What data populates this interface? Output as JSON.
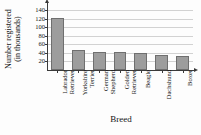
{
  "chart_data": {
    "type": "bar",
    "title": "American Kennel Club",
    "xlabel": "Breed",
    "ylabel_line1": "Number registered",
    "ylabel_line2": "(in thousands)",
    "ylabel": "Number registered (in thousands)",
    "categories": [
      "Labrador Retriever",
      "Yorkshire Terrier",
      "German Shepherd",
      "Golden Retriever",
      "Beagle",
      "Dachshund",
      "Boxer"
    ],
    "category_lines": [
      [
        "Labrador",
        "Retriever"
      ],
      [
        "Yorkshire",
        "Terrier"
      ],
      [
        "German",
        "Shepherd"
      ],
      [
        "Golden",
        "Retriever"
      ],
      [
        "Beagle"
      ],
      [
        "Dachshund"
      ],
      [
        "Boxer"
      ]
    ],
    "values": [
      123,
      47,
      43,
      42,
      39,
      35,
      34
    ],
    "ylim": [
      0,
      150
    ],
    "yticks": [
      20,
      40,
      60,
      80,
      100,
      120,
      140
    ],
    "ytick_labels": [
      "20",
      "40",
      "60",
      "80",
      "100",
      "120",
      "140"
    ],
    "grid": true,
    "legend": "none",
    "bar_color": "#9d9d9d",
    "bar_edge_color": "#6f6f6f",
    "axis_color": "#3a3a3a",
    "grid_color": "#d2d2d2",
    "background": "#fdfdfd"
  }
}
